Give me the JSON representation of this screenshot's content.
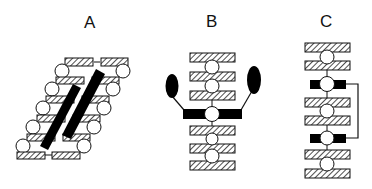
{
  "panels": [
    {
      "id": "A",
      "label": "A",
      "description": "Tilted stack of hatched bars and circles crossed by two diagonal black bars"
    },
    {
      "id": "B",
      "label": "B",
      "description": "Vertical stack of hatched bars and circles with a central black bar bearing two black oval lobes"
    },
    {
      "id": "C",
      "label": "C",
      "description": "Vertical stack of hatched bars and circles with two black bars joined by a right-side connector line"
    }
  ],
  "colors": {
    "outline": "#111111",
    "fill_black": "#000000",
    "background": "#ffffff"
  }
}
